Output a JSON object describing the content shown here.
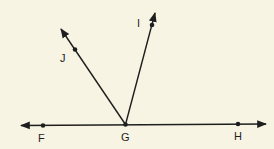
{
  "diagram": {
    "background": "#f7f4e4",
    "stroke_color": "#1e1e1e",
    "line": {
      "name": "line FH",
      "points": [
        "F",
        "G",
        "H"
      ]
    },
    "rays": [
      {
        "name": "ray GJ",
        "from": "G",
        "through": "J"
      },
      {
        "name": "ray GI",
        "from": "G",
        "through": "I"
      }
    ],
    "points": {
      "F": {
        "label": "F"
      },
      "G": {
        "label": "G"
      },
      "H": {
        "label": "H"
      },
      "I": {
        "label": "I"
      },
      "J": {
        "label": "J"
      }
    }
  }
}
